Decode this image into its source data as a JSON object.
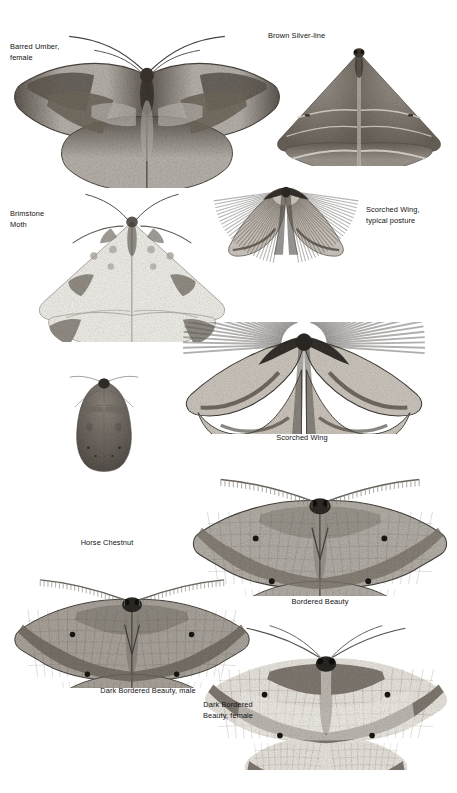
{
  "page": {
    "kind": "field-guide-plate",
    "background_color": "#ffffff",
    "text_color": "#111111",
    "width": 457,
    "height": 793
  },
  "specimens": [
    {
      "id": "barred-umber-female",
      "label": "Barred Umber,\nfemale",
      "posture": "spread",
      "label_align": "left",
      "label_x": 10,
      "label_y": 42,
      "fig_x": 8,
      "fig_y": 28,
      "fig_w": 278,
      "fig_h": 160,
      "colors": {
        "wing": "#b7b2ab",
        "wing_dark": "#5d574f",
        "band": "#6f675c",
        "body": "#3a342d",
        "edge": "#4a443c"
      }
    },
    {
      "id": "brown-silver-line",
      "label": "Brown Silver-line",
      "posture": "deltoid",
      "label_align": "left",
      "label_x": 268,
      "label_y": 31,
      "fig_x": 266,
      "fig_y": 38,
      "fig_w": 186,
      "fig_h": 128,
      "colors": {
        "wing": "#9c958c",
        "wing_dark": "#6a6259",
        "band": "#d8d3cb",
        "body": "#3f3932",
        "edge": "#56504a"
      }
    },
    {
      "id": "brimstone-moth",
      "label": "Brimstone\nMoth",
      "posture": "spread-pale",
      "label_align": "left",
      "label_x": 10,
      "label_y": 209,
      "fig_x": 26,
      "fig_y": 190,
      "fig_w": 212,
      "fig_h": 152,
      "colors": {
        "wing": "#f0efe9",
        "wing_dark": "#8d8880",
        "band": "#b4aea5",
        "body": "#4a443c",
        "edge": "#a8a29a"
      }
    },
    {
      "id": "scorched-wing-typical-posture",
      "label": "Scorched Wing,\ntypical posture",
      "posture": "scorched-raised",
      "label_align": "left",
      "label_x": 366,
      "label_y": 205,
      "fig_x": 210,
      "fig_y": 180,
      "fig_w": 152,
      "fig_h": 112,
      "colors": {
        "wing": "#cfc9c0",
        "wing_dark": "#4e473f",
        "band": "#766d62",
        "body": "#2e2a25",
        "edge": "#3c3731"
      }
    },
    {
      "id": "scorched-wing",
      "label": "Scorched Wing",
      "posture": "scorched-spread",
      "label_align": "center",
      "label_x": 232,
      "label_y": 433,
      "label_w": 140,
      "fig_x": 178,
      "fig_y": 322,
      "fig_w": 252,
      "fig_h": 112,
      "colors": {
        "wing": "#cdc7be",
        "wing_dark": "#4a433b",
        "band": "#6e665c",
        "body": "#2c2824",
        "edge": "#3a352f"
      }
    },
    {
      "id": "horse-chestnut",
      "label": "Horse Chestnut",
      "posture": "folded",
      "label_align": "center",
      "label_x": 42,
      "label_y": 538,
      "label_w": 130,
      "fig_x": 52,
      "fig_y": 372,
      "fig_w": 104,
      "fig_h": 162,
      "colors": {
        "wing": "#8e877e",
        "wing_dark": "#56504a",
        "band": "#6d665e",
        "body": "#332f2a",
        "edge": "#46413b"
      }
    },
    {
      "id": "bordered-beauty",
      "label": "Bordered Beauty",
      "posture": "beauty",
      "label_align": "center",
      "label_x": 255,
      "label_y": 597,
      "label_w": 130,
      "fig_x": 186,
      "fig_y": 458,
      "fig_w": 268,
      "fig_h": 138,
      "colors": {
        "wing": "#b4afa7",
        "wing_dark": "#6e675e",
        "band": "#7d756b",
        "body": "#2f2b26",
        "edge": "#45403a",
        "spot": "#1b1815"
      }
    },
    {
      "id": "dark-bordered-beauty-male",
      "label": "Dark Bordered Beauty, male",
      "posture": "beauty",
      "label_align": "center",
      "label_x": 58,
      "label_y": 686,
      "label_w": 180,
      "fig_x": 8,
      "fig_y": 560,
      "fig_w": 248,
      "fig_h": 128,
      "colors": {
        "wing": "#aaa49c",
        "wing_dark": "#5f584f",
        "band": "#6d655b",
        "body": "#2c2824",
        "edge": "#413c36",
        "spot": "#171512"
      }
    },
    {
      "id": "dark-bordered-beauty-female",
      "label": "Dark Bordered\nBeauty, female",
      "posture": "beauty-female",
      "label_align": "center",
      "label_x": 172,
      "label_y": 700,
      "label_w": 112,
      "fig_x": 198,
      "fig_y": 618,
      "fig_w": 256,
      "fig_h": 152,
      "colors": {
        "wing": "#e2ded7",
        "wing_dark": "#6c655c",
        "band": "#7b736a",
        "body": "#2b2723",
        "edge": "#484views",
        "spot": "#171512"
      }
    }
  ]
}
